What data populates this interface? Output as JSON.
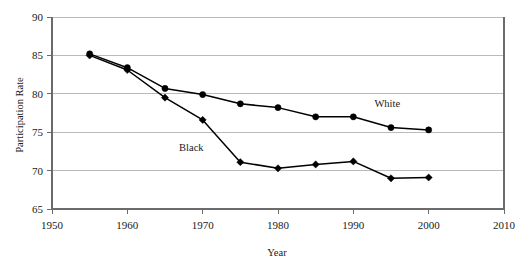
{
  "chart_data": {
    "type": "line",
    "title": "",
    "xlabel": "Year",
    "ylabel": "Participation Rate",
    "xlim": [
      1950,
      2010
    ],
    "ylim": [
      65,
      90
    ],
    "xticks": [
      1950,
      1960,
      1970,
      1980,
      1990,
      2000,
      2010
    ],
    "yticks": [
      65,
      70,
      75,
      80,
      85,
      90
    ],
    "grid": "horizontal",
    "legend_position": "inline-annotations",
    "x": [
      1955,
      1960,
      1965,
      1970,
      1975,
      1980,
      1985,
      1990,
      1995,
      2000
    ],
    "series": [
      {
        "name": "White",
        "marker": "circle",
        "values": [
          85.2,
          83.4,
          80.7,
          79.9,
          78.7,
          78.2,
          77.0,
          77.0,
          75.6,
          75.3
        ]
      },
      {
        "name": "Black",
        "marker": "diamond",
        "values": [
          85.0,
          83.1,
          79.5,
          76.6,
          71.1,
          70.3,
          70.8,
          71.2,
          69.0,
          69.1
        ]
      }
    ],
    "annotations": [
      {
        "text": "White",
        "x": 1994.5,
        "y": 78.3
      },
      {
        "text": "Black",
        "x": 1968.5,
        "y": 72.6
      }
    ],
    "colors": {
      "series_line": "#000000",
      "marker": "#000000",
      "gridline": "#a9a9a9",
      "axis": "#6b6b6b",
      "text": "#1a1a1a",
      "background": "#ffffff"
    }
  },
  "axis_labels": {
    "y_title": "Participation Rate",
    "x_title": "Year"
  },
  "y_tick_labels": [
    "65",
    "70",
    "75",
    "80",
    "85",
    "90"
  ],
  "x_tick_labels": [
    "1950",
    "1960",
    "1970",
    "1980",
    "1990",
    "2000",
    "2010"
  ],
  "series_names": {
    "white": "White",
    "black": "Black"
  }
}
